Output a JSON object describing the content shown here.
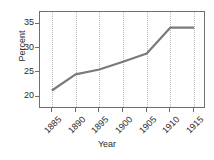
{
  "chart_data": {
    "type": "line",
    "title": "",
    "xlabel": "Year",
    "ylabel": "Percent",
    "x": [
      1885,
      1890,
      1895,
      1900,
      1905,
      1910,
      1915
    ],
    "categories": [
      "1885",
      "1890",
      "1895",
      "1900",
      "1905",
      "1910",
      "1915"
    ],
    "values": [
      21.3,
      24.6,
      25.6,
      27.2,
      28.9,
      34.2,
      34.2
    ],
    "series": [
      {
        "name": "Percent",
        "values": [
          21.3,
          24.6,
          25.6,
          27.2,
          28.9,
          34.2,
          34.2
        ]
      }
    ],
    "xlim": [
      1882.5,
      1917.5
    ],
    "ylim": [
      17.5,
      37.4
    ],
    "yticks": [
      20,
      25,
      30,
      35
    ],
    "ytick_labels": [
      "20",
      "25",
      "30",
      "35"
    ],
    "xticks": [
      1885,
      1890,
      1895,
      1900,
      1905,
      1910,
      1915
    ],
    "xtick_labels": [
      "1885",
      "1890",
      "1895",
      "1900",
      "1905",
      "1910",
      "1915"
    ],
    "xtick_rotation": -45,
    "grid": "vertical-dotted",
    "legend": "none",
    "line_color": "#7a7a7a",
    "line_width": 2.2,
    "frame_color": "#6f6f6f",
    "grid_color": "#b9b9b9",
    "text_color": "#2b2b2b",
    "background": "#ffffff"
  }
}
